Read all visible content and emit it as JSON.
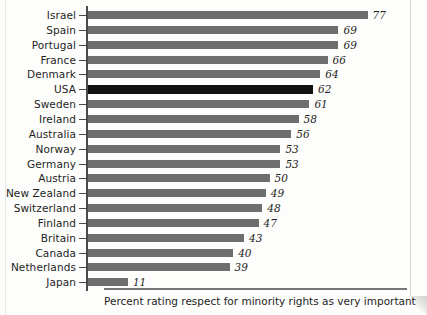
{
  "chart_data": {
    "type": "bar",
    "orientation": "horizontal",
    "title": "",
    "xlabel": "Percent rating respect for minority rights as very important",
    "ylabel": "",
    "xlim": [
      0,
      80
    ],
    "grid": false,
    "legend": null,
    "value_label_suffix": "",
    "categories": [
      "Israel",
      "Spain",
      "Portugal",
      "France",
      "Denmark",
      "USA",
      "Sweden",
      "Ireland",
      "Australia",
      "Norway",
      "Germany",
      "Austria",
      "New Zealand",
      "Switzerland",
      "Finland",
      "Britain",
      "Canada",
      "Netherlands",
      "Japan"
    ],
    "values": [
      77,
      69,
      69,
      66,
      64,
      62,
      61,
      58,
      56,
      53,
      53,
      50,
      49,
      48,
      47,
      43,
      40,
      39,
      11
    ],
    "value_labels": [
      "77",
      "69",
      "69",
      "66",
      "64",
      "62",
      "61",
      "58",
      "56",
      "53",
      "53",
      "50",
      "49",
      "48",
      "47",
      "43",
      "40",
      "39",
      "11"
    ],
    "highlighted_category": "USA",
    "colors": {
      "bar": "#6e6e6e",
      "bar_highlight": "#111111",
      "axis": "#4a4a4a",
      "text": "#1d1d1d",
      "background": "#fdfdfc",
      "caption_rule": "#777777"
    }
  },
  "caption": {
    "text": "Percent rating respect for minority rights as very important"
  }
}
